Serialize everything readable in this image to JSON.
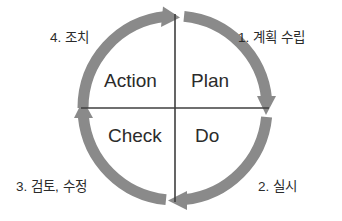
{
  "diagram": {
    "type": "pdca-cycle",
    "colors": {
      "arc": "#8a8a8a",
      "divider": "#3f3f3f",
      "text": "#2b2b2b",
      "background": "#ffffff"
    },
    "geometry": {
      "center_x": 175,
      "center_y": 108,
      "radius": 92,
      "arc_stroke_width": 11
    },
    "quadrants": [
      {
        "id": "plan",
        "label": "Plan",
        "caption": "1. 계획 수립",
        "position": "top-right"
      },
      {
        "id": "do",
        "label": "Do",
        "caption": "2. 실시",
        "position": "bottom-right"
      },
      {
        "id": "check",
        "label": "Check",
        "caption": "3. 검토, 수정",
        "position": "bottom-left"
      },
      {
        "id": "action",
        "label": "Action",
        "caption": "4. 조치",
        "position": "top-left"
      }
    ],
    "arrows": [
      {
        "id": "plan-arrow",
        "from": "top",
        "to": "right",
        "direction": "clockwise",
        "head": "down"
      },
      {
        "id": "do-arrow",
        "from": "right",
        "to": "bottom",
        "direction": "clockwise",
        "head": "left"
      },
      {
        "id": "check-arrow",
        "from": "bottom",
        "to": "left",
        "direction": "clockwise",
        "head": "up"
      },
      {
        "id": "action-arrow",
        "from": "left",
        "to": "top",
        "direction": "clockwise",
        "head": "right"
      }
    ]
  }
}
